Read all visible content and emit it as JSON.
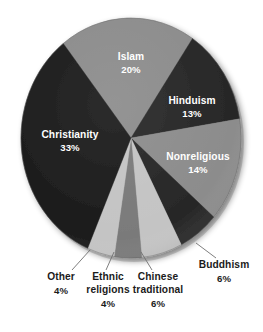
{
  "chart_data": {
    "type": "pie",
    "title": "",
    "subtitle": "",
    "xlabel": "",
    "ylabel": "",
    "legend_position": "none",
    "grid": false,
    "units": "percent",
    "categories": [
      "Islam",
      "Hinduism",
      "Nonreligious",
      "Buddhism",
      "Chinese traditional",
      "Ethnic religions",
      "Other",
      "Christianity"
    ],
    "values": [
      20,
      13,
      14,
      6,
      6,
      4,
      4,
      33
    ],
    "slices": [
      {
        "name": "Islam",
        "label": "Islam",
        "pct_text": "20%",
        "value": 20,
        "color": "#8c8c8c",
        "label_placement": "inside",
        "label_x": 131,
        "label_y": 60,
        "pct_x": 131,
        "pct_y": 73
      },
      {
        "name": "Hinduism",
        "label": "Hinduism",
        "pct_text": "13%",
        "value": 13,
        "color": "#272727",
        "label_placement": "inside",
        "label_x": 192,
        "label_y": 104,
        "pct_x": 192,
        "pct_y": 117
      },
      {
        "name": "Nonreligious",
        "label": "Nonreligious",
        "pct_text": "14%",
        "value": 14,
        "color": "#8c8c8c",
        "label_placement": "inside",
        "label_x": 198,
        "label_y": 160,
        "pct_x": 198,
        "pct_y": 173
      },
      {
        "name": "Buddhism",
        "label": "Buddhism",
        "pct_text": "6%",
        "value": 6,
        "color": "#272727",
        "label_placement": "outside",
        "label_x": 224,
        "label_y": 268,
        "pct_x": 224,
        "pct_y": 282,
        "leader": {
          "x1": 196,
          "y1": 243,
          "x2": 216,
          "y2": 258
        }
      },
      {
        "name": "Chinese traditional",
        "label_line1": "Chinese",
        "label_line2": "traditional",
        "pct_text": "6%",
        "value": 6,
        "color": "#c4c4c4",
        "label_placement": "outside",
        "label_x": 158,
        "label_y": 280,
        "label2_x": 158,
        "label2_y": 293,
        "pct_x": 158,
        "pct_y": 307,
        "leader": {
          "x1": 141,
          "y1": 252,
          "x2": 152,
          "y2": 270
        }
      },
      {
        "name": "Ethnic religions",
        "label_line1": "Ethnic",
        "label_line2": "religions",
        "pct_text": "4%",
        "value": 4,
        "color": "#7a7a7a",
        "label_placement": "outside",
        "label_x": 108,
        "label_y": 280,
        "label2_x": 108,
        "label2_y": 293,
        "pct_x": 108,
        "pct_y": 307,
        "leader": {
          "x1": 114,
          "y1": 252,
          "x2": 106,
          "y2": 270
        }
      },
      {
        "name": "Other",
        "label": "Other",
        "pct_text": "4%",
        "value": 4,
        "color": "#c4c4c4",
        "label_placement": "outside",
        "label_x": 61,
        "label_y": 280,
        "pct_x": 61,
        "pct_y": 294,
        "leader": {
          "x1": 90,
          "y1": 250,
          "x2": 72,
          "y2": 270
        }
      },
      {
        "name": "Christianity",
        "label": "Christianity",
        "pct_text": "33%",
        "value": 33,
        "color": "#1c1c1c",
        "label_placement": "inside",
        "label_x": 70,
        "label_y": 138,
        "pct_x": 70,
        "pct_y": 151
      }
    ]
  },
  "figure": {
    "background_color": "#ffffff",
    "pie_center_x": 131,
    "pie_center_y": 138,
    "pie_radius_x": 110,
    "pie_radius_y": 120,
    "shadow_color": "#b9b9b9"
  }
}
